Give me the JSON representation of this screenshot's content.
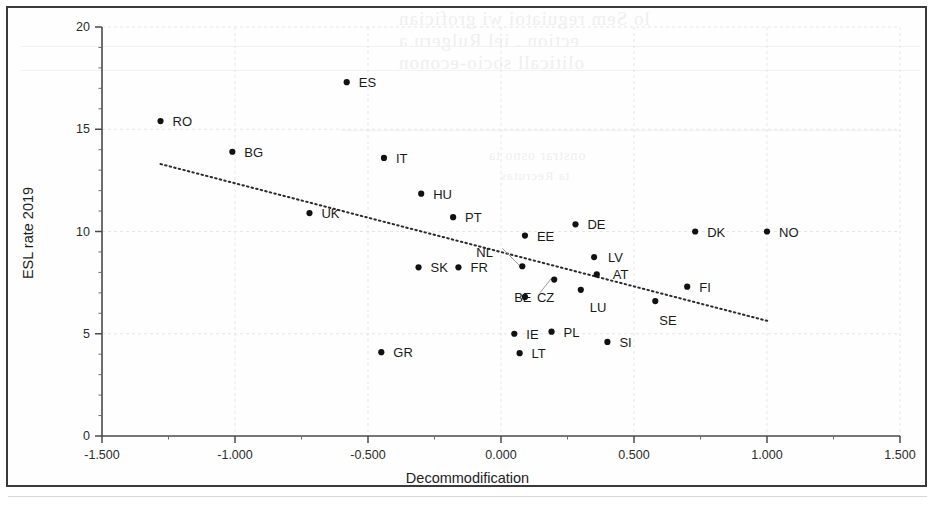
{
  "chart_data": {
    "type": "scatter",
    "title": "",
    "xlabel": "Decommodification",
    "ylabel": "ESL rate 2019",
    "xlim": [
      -1.5,
      1.5
    ],
    "ylim": [
      0,
      20
    ],
    "xticks": [
      "-1.500",
      "-1.000",
      "-0.500",
      "0.000",
      "0.500",
      "1.000",
      "1.500"
    ],
    "xtick_values": [
      -1.5,
      -1.0,
      -0.5,
      0.0,
      0.5,
      1.0,
      1.5
    ],
    "yticks": [
      "0",
      "5",
      "10",
      "15",
      "20"
    ],
    "ytick_values": [
      0,
      5,
      10,
      15,
      20
    ],
    "grid": true,
    "legend": "none",
    "marker_color": "#111111",
    "trendline": {
      "style": "dotted",
      "color": "#2b2b2b",
      "x_start": -1.28,
      "y_start": 13.3,
      "x_end": 1.01,
      "y_end": 5.6
    },
    "points": [
      {
        "label": "RO",
        "x": -1.28,
        "y": 15.4,
        "label_dx": 12,
        "label_dy": 0
      },
      {
        "label": "BG",
        "x": -1.01,
        "y": 13.9,
        "label_dx": 12,
        "label_dy": 0
      },
      {
        "label": "ES",
        "x": -0.58,
        "y": 17.3,
        "label_dx": 12,
        "label_dy": 0
      },
      {
        "label": "IT",
        "x": -0.44,
        "y": 13.6,
        "label_dx": 12,
        "label_dy": 0
      },
      {
        "label": "GR",
        "x": -0.45,
        "y": 4.1,
        "label_dx": 12,
        "label_dy": 0
      },
      {
        "label": "UK",
        "x": -0.72,
        "y": 10.9,
        "label_dx": 12,
        "label_dy": 0
      },
      {
        "label": "HU",
        "x": -0.3,
        "y": 11.85,
        "label_dx": 12,
        "label_dy": 0
      },
      {
        "label": "SK",
        "x": -0.31,
        "y": 8.25,
        "label_dx": 12,
        "label_dy": 0
      },
      {
        "label": "PT",
        "x": -0.18,
        "y": 10.7,
        "label_dx": 12,
        "label_dy": 0
      },
      {
        "label": "FR",
        "x": -0.16,
        "y": 8.25,
        "label_dx": 12,
        "label_dy": 0
      },
      {
        "label": "EE",
        "x": 0.09,
        "y": 9.8,
        "label_dx": 12,
        "label_dy": 0
      },
      {
        "label": "CZ",
        "x": 0.09,
        "y": 6.8,
        "label_dx": 12,
        "label_dy": 0
      },
      {
        "label": "IE",
        "x": 0.05,
        "y": 5.0,
        "label_dx": 12,
        "label_dy": 0
      },
      {
        "label": "LT",
        "x": 0.07,
        "y": 4.05,
        "label_dx": 12,
        "label_dy": 0
      },
      {
        "label": "PL",
        "x": 0.19,
        "y": 5.1,
        "label_dx": 12,
        "label_dy": 0
      },
      {
        "label": "DE",
        "x": 0.28,
        "y": 10.35,
        "label_dx": 12,
        "label_dy": 0
      },
      {
        "label": "LU",
        "x": 0.3,
        "y": 7.15,
        "label_dx": 9,
        "label_dy": 17
      },
      {
        "label": "LV",
        "x": 0.35,
        "y": 8.75,
        "label_dx": 14,
        "label_dy": 0
      },
      {
        "label": "AT",
        "x": 0.36,
        "y": 7.9,
        "label_dx": 16,
        "label_dy": 0
      },
      {
        "label": "SI",
        "x": 0.4,
        "y": 4.6,
        "label_dx": 12,
        "label_dy": 0
      },
      {
        "label": "SE",
        "x": 0.58,
        "y": 6.6,
        "label_dx": 4,
        "label_dy": 19
      },
      {
        "label": "FI",
        "x": 0.7,
        "y": 7.3,
        "label_dx": 12,
        "label_dy": 0
      },
      {
        "label": "DK",
        "x": 0.73,
        "y": 10.0,
        "label_dx": 12,
        "label_dy": 0
      },
      {
        "label": "NO",
        "x": 1.0,
        "y": 10.0,
        "label_dx": 12,
        "label_dy": 0
      },
      {
        "label": "NL",
        "x": 0.08,
        "y": 8.3,
        "label_dx": -46,
        "label_dy": -14,
        "leader": true
      },
      {
        "label": "BE",
        "x": 0.2,
        "y": 7.65,
        "label_dx": -40,
        "label_dy": 17,
        "leader": true
      }
    ]
  },
  "ghost_text": {
    "lines": [
      {
        "text": "lo Sem reguiatoi wi grofician",
        "x": 398,
        "y": 8,
        "size": 19
      },
      {
        "text": "ection . iel Rulgeru a",
        "x": 398,
        "y": 30,
        "size": 19
      },
      {
        "text": "oliticall socio-econon",
        "x": 398,
        "y": 52,
        "size": 19
      },
      {
        "text": "onstrar osno ta",
        "x": 488,
        "y": 148,
        "size": 14
      },
      {
        "text": "ta Recrutas",
        "x": 500,
        "y": 168,
        "size": 13
      }
    ]
  }
}
